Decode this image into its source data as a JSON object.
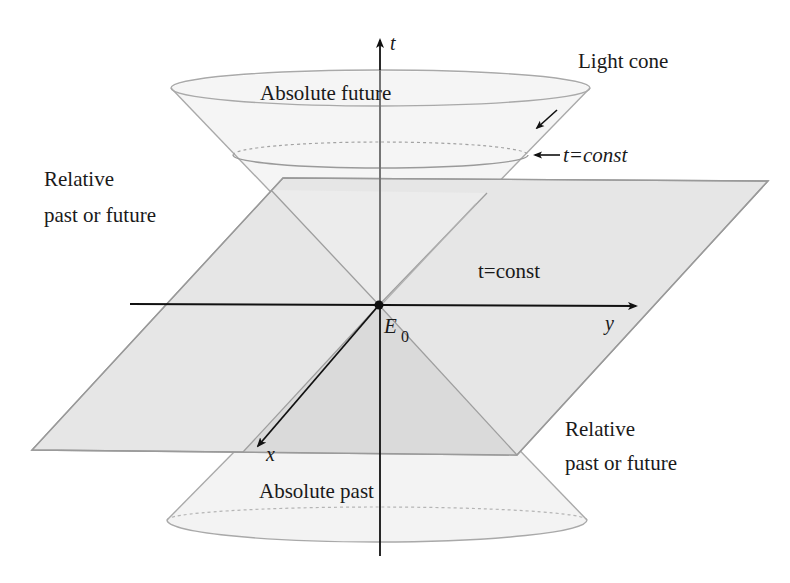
{
  "figure": {
    "colors": {
      "background": "#ffffff",
      "plane_fill": "#e6e6e6",
      "plane_inner_fill": "#dcdcdc",
      "cone_fill": "#f3f3f3",
      "cone_stroke": "#a9a9a9",
      "plane_stroke": "#9a9a9a",
      "axis": "#111111",
      "text": "#1a1a1a"
    }
  },
  "labels": {
    "light_cone": "Light cone",
    "t_const_arrow": "t=const",
    "absolute_future": "Absolute future",
    "absolute_past": "Absolute past",
    "relative_left_line1": "Relative",
    "relative_left_line2": "past or future",
    "relative_right_line1": "Relative",
    "relative_right_line2": "past or future",
    "plane_label": "t=const",
    "event_main": "E",
    "event_sub": "0"
  },
  "axes": {
    "t": "t",
    "x": "x",
    "y": "y"
  }
}
